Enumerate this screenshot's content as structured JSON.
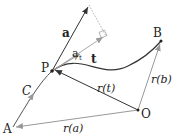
{
  "diagram": {
    "points": {
      "A": "A",
      "B": "B",
      "O": "O",
      "P": "P"
    },
    "labels": {
      "a": "a",
      "a_t": "a",
      "a_t_sub": "t",
      "t": "t",
      "C": "C",
      "r_t": "r(t)",
      "r_a": "r(a)",
      "r_b": "r(b)"
    },
    "colors": {
      "dark": "#333333",
      "gray": "#9a9a9a",
      "dotted": "#b0b0b0"
    }
  }
}
